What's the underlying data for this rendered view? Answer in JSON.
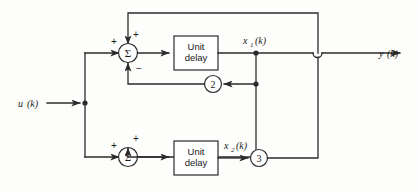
{
  "diagram": {
    "type": "control-system-block-diagram",
    "colors": {
      "line": "#2b2b2b",
      "background": "#fdfdfc",
      "text": "#1a1a1a"
    },
    "signals": {
      "input": {
        "base": "u",
        "arg": "(k)",
        "full": "u (k)"
      },
      "output": {
        "base": "y",
        "arg": "(k)",
        "full": "y (k)"
      },
      "state1": {
        "base": "x",
        "sub": "1",
        "arg": "(k)",
        "full": "x1 (k)"
      },
      "state2": {
        "base": "x",
        "sub": "2",
        "arg": "(k)",
        "full": "x2 (k)"
      }
    },
    "blocks": [
      {
        "id": "unit-delay-top",
        "kind": "box",
        "line1": "Unit",
        "line2": "delay"
      },
      {
        "id": "unit-delay-bottom",
        "kind": "box",
        "line1": "Unit",
        "line2": "delay"
      }
    ],
    "summers": [
      {
        "id": "summer-top",
        "symbol": "Σ",
        "signs": [
          "+",
          "+",
          "−"
        ]
      },
      {
        "id": "summer-bottom",
        "symbol": "Σ",
        "signs": [
          "+",
          "+"
        ]
      }
    ],
    "gains": [
      {
        "id": "gain-2",
        "value": "2"
      },
      {
        "id": "gain-3",
        "value": "3"
      }
    ],
    "signs": {
      "plus": "+",
      "minus": "−"
    }
  }
}
